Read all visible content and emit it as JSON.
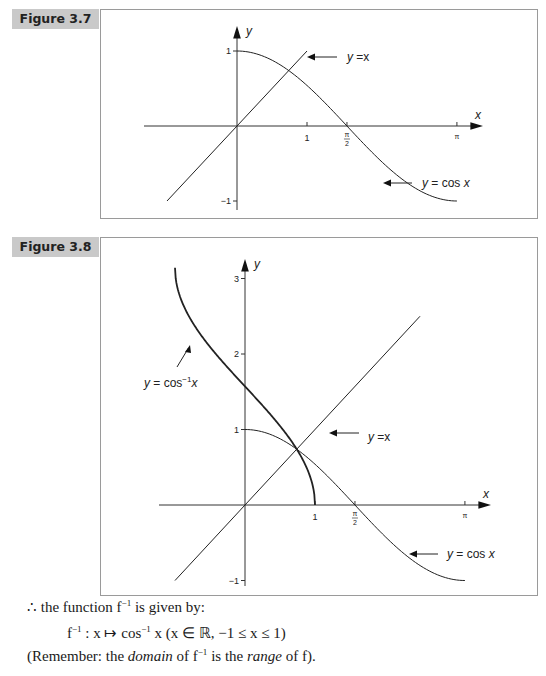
{
  "figures": [
    {
      "label": "Figure 3.7",
      "x_axis_label": "x",
      "y_axis_label": "y",
      "x_ticks": [
        {
          "value": 1,
          "label": "1"
        },
        {
          "value": 1.5708,
          "label_num": "π",
          "label_den": "2"
        },
        {
          "value": 3.1416,
          "label": "π"
        }
      ],
      "y_ticks": [
        {
          "value": 1,
          "label": "1"
        },
        {
          "value": -1,
          "label": "−1"
        }
      ],
      "annotations": [
        {
          "text_lhs": "y",
          "text_rhs": "=x",
          "target": "line"
        },
        {
          "text_lhs": "y",
          "text_rhs": "= cos x",
          "target": "cos"
        }
      ]
    },
    {
      "label": "Figure 3.8",
      "x_axis_label": "x",
      "y_axis_label": "y",
      "x_ticks": [
        {
          "value": 1,
          "label": "1"
        },
        {
          "value": 1.5708,
          "label_num": "π",
          "label_den": "2"
        },
        {
          "value": 3.1416,
          "label": "π"
        }
      ],
      "y_ticks": [
        {
          "value": 3,
          "label": "3"
        },
        {
          "value": 2,
          "label": "2"
        },
        {
          "value": 1,
          "label": "1"
        },
        {
          "value": -1,
          "label": "−1"
        }
      ],
      "annotations": [
        {
          "text_lhs": "y",
          "text_rhs": "=x",
          "target": "line"
        },
        {
          "text_lhs": "y",
          "text_rhs": "= cos x",
          "target": "cos"
        },
        {
          "text_lhs": "y",
          "text_rhs": "= cos",
          "sup": "−1",
          "tail": "x",
          "target": "arccos"
        }
      ]
    }
  ],
  "chart_data": [
    {
      "type": "line",
      "title": "Figure 3.7",
      "xlabel": "x",
      "ylabel": "y",
      "xlim": [
        -1,
        3.5
      ],
      "ylim": [
        -1,
        1.3
      ],
      "series": [
        {
          "name": "y = x",
          "x": [
            -1,
            1
          ],
          "y": [
            -1,
            1
          ]
        },
        {
          "name": "y = cos x",
          "x": [
            0,
            0.5,
            1,
            1.5708,
            2,
            2.5,
            3.1416
          ],
          "y": [
            1,
            0.878,
            0.54,
            0,
            -0.416,
            -0.801,
            -1
          ]
        }
      ]
    },
    {
      "type": "line",
      "title": "Figure 3.8",
      "xlabel": "x",
      "ylabel": "y",
      "xlim": [
        -1,
        3.5
      ],
      "ylim": [
        -1,
        3.3
      ],
      "series": [
        {
          "name": "y = x",
          "x": [
            -1,
            2.5
          ],
          "y": [
            -1,
            2.5
          ]
        },
        {
          "name": "y = cos x",
          "x": [
            0,
            0.5,
            1,
            1.5708,
            2,
            2.5,
            3.1416
          ],
          "y": [
            1,
            0.878,
            0.54,
            0,
            -0.416,
            -0.801,
            -1
          ]
        },
        {
          "name": "y = cos⁻¹x",
          "x": [
            -1,
            -0.5,
            0,
            0.5,
            1
          ],
          "y": [
            3.1416,
            2.094,
            1.5708,
            1.047,
            0
          ]
        }
      ]
    }
  ],
  "text": {
    "line1_prefix": "∴ the function f",
    "line1_sup": "−1",
    "line1_suffix": " is given by:",
    "line2_f": "f",
    "line2_sup1": "−1",
    "line2_mid": " : x ↦ cos",
    "line2_sup2": "−1",
    "line2_suffix": " x (x ∈ ℝ, −1 ≤ x ≤ 1)",
    "line3_a": "(Remember: the ",
    "line3_domain": "domain",
    "line3_b": " of f",
    "line3_sup": "−1",
    "line3_c": " is the ",
    "line3_range": "range",
    "line3_d": " of f)."
  }
}
